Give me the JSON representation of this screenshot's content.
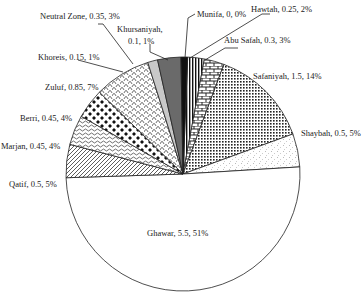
{
  "chart_data": {
    "type": "pie",
    "title": "",
    "center": [
      183,
      174
    ],
    "radius": 117,
    "slices": [
      {
        "name": "Hawtah",
        "value": 0.25,
        "pct": "2%",
        "label": "Hawtah, 0.25, 2%",
        "pattern": "vstripes"
      },
      {
        "name": "Abu Safah",
        "value": 0.3,
        "pct": "3%",
        "label": "Abu Safah, 0.3, 3%",
        "pattern": "brick"
      },
      {
        "name": "Safaniyah",
        "value": 1.5,
        "pct": "14%",
        "label": "Safaniyah, 1.5, 14%",
        "pattern": "dots"
      },
      {
        "name": "Shaybah",
        "value": 0.5,
        "pct": "5%",
        "label": "Shaybah, 0.5, 5%",
        "pattern": "speckle"
      },
      {
        "name": "Ghawar",
        "value": 5.5,
        "pct": "51%",
        "label": "Ghawar, 5.5, 51%",
        "pattern": "white"
      },
      {
        "name": "Qatif",
        "value": 0.5,
        "pct": "5%",
        "label": "Qatif, 0.5, 5%",
        "pattern": "diag"
      },
      {
        "name": "Marjan",
        "value": 0.45,
        "pct": "4%",
        "label": "Marjan, 0.45, 4%",
        "pattern": "wave"
      },
      {
        "name": "Berri",
        "value": 0.45,
        "pct": "4%",
        "label": "Berri, 0.45, 4%",
        "pattern": "checker"
      },
      {
        "name": "Zuluf",
        "value": 0.85,
        "pct": "7%",
        "label": "Zuluf, 0.85, 7%",
        "pattern": "scale"
      },
      {
        "name": "Khoreis",
        "value": 0.15,
        "pct": "1%",
        "label": "Khoreis, 0.15, 1%",
        "pattern": "lightgray"
      },
      {
        "name": "Neutral Zone",
        "value": 0.35,
        "pct": "3%",
        "label": "Neutral Zone, 0.35, 3%",
        "pattern": "darkgray"
      },
      {
        "name": "Khursaniyah",
        "value": 0.1,
        "pct": "1%",
        "label": "Khursaniyah, 0.1, 1%",
        "pattern": "black"
      },
      {
        "name": "Munifa",
        "value": 0,
        "pct": "0%",
        "label": "Munifa, 0, 0%",
        "pattern": "none"
      }
    ],
    "labels": {
      "munifa": "Munifa, 0, 0%",
      "hawtah": "Hawtah, 0.25, 2%",
      "abu_safah": "Abu Safah, 0.3, 3%",
      "safaniyah": "Safaniyah, 1.5, 14%",
      "shaybah": "Shaybah, 0.5, 5%",
      "ghawar": "Ghawar, 5.5, 51%",
      "qatif": "Qatif, 0.5, 5%",
      "marjan": "Marjan, 0.45, 4%",
      "berri": "Berri, 0.45, 4%",
      "zuluf": "Zuluf, 0.85, 7%",
      "khoreis": "Khoreis, 0.15, 1%",
      "neutral_zone": "Neutral Zone, 0.35, 3%",
      "khursaniyah_1": "Khursaniyah,",
      "khursaniyah_2": "0.1, 1%"
    },
    "legend": "none",
    "grid": false
  }
}
